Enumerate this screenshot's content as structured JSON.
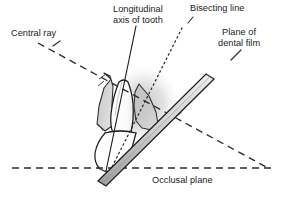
{
  "figure": {
    "width": 285,
    "height": 206,
    "background_color": "#ffffff",
    "ink_color": "#1a1a1a",
    "shading_color": "#c9c9c9"
  },
  "labels": {
    "central_ray": "Central ray",
    "longitudinal_axis": "Longitudinal\naxis of tooth",
    "bisecting_line": "Bisecting line",
    "film_plane": "Plane of\ndental film",
    "occlusal_plane": "Occlusal plane"
  },
  "elements": {
    "central_ray": {
      "name": "Central ray",
      "style": "dashed",
      "from": [
        38,
        43
      ],
      "to": [
        268,
        168
      ]
    },
    "longitudinal_axis": {
      "name": "Longitudinal axis of tooth",
      "style": "solid",
      "from": [
        134,
        28
      ],
      "to": [
        107,
        170
      ]
    },
    "bisecting_line": {
      "name": "Bisecting line",
      "style": "dotted",
      "from": [
        180,
        30
      ],
      "to": [
        110,
        170
      ]
    },
    "film_plane": {
      "name": "Plane of dental film",
      "style": "solid-bar",
      "from": [
        101,
        182
      ],
      "to": [
        209,
        75
      ]
    },
    "occlusal_plane": {
      "name": "Occlusal plane",
      "style": "dashed",
      "from": [
        12,
        168
      ],
      "to": [
        274,
        168
      ]
    },
    "tooth": {
      "name": "Tooth (incisor)",
      "parts": [
        "root",
        "crown",
        "gingiva",
        "alveolar bone"
      ]
    }
  }
}
